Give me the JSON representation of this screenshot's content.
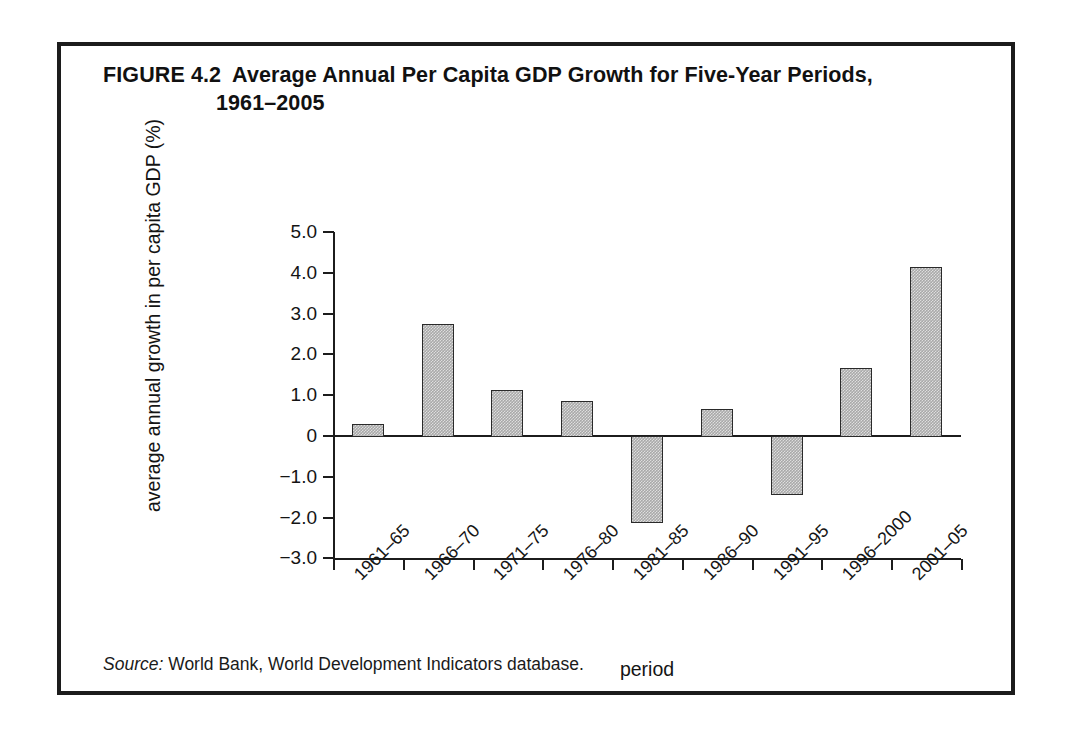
{
  "figure": {
    "label": "FIGURE 4.2",
    "title_line1": "Average Annual Per Capita GDP Growth for Five-Year Periods,",
    "title_line2": "1961–2005",
    "source_label": "Source:",
    "source_text": "World Bank, World Development Indicators database."
  },
  "chart_data": {
    "type": "bar",
    "xlabel": "period",
    "ylabel": "average annual growth in per capita GDP (%)",
    "categories": [
      "1961–65",
      "1966–70",
      "1971–75",
      "1976–80",
      "1981–85",
      "1986–90",
      "1991–95",
      "1996–2000",
      "2001–05"
    ],
    "values": [
      0.3,
      2.75,
      1.13,
      0.85,
      -2.13,
      0.67,
      -1.45,
      1.67,
      4.13
    ],
    "ylim": [
      -3.0,
      5.0
    ],
    "ytick_labels": [
      "5.0",
      "4.0",
      "3.0",
      "2.0",
      "1.0",
      "0",
      "−1.0",
      "−2.0",
      "−3.0"
    ],
    "ytick_values": [
      5.0,
      4.0,
      3.0,
      2.0,
      1.0,
      0,
      -1.0,
      -2.0,
      -3.0
    ],
    "grid": false,
    "legend": null,
    "bar_color": "#a9a9a9",
    "bar_edge_color": "#2a2a2a",
    "axis_color": "#1c1c1c"
  }
}
